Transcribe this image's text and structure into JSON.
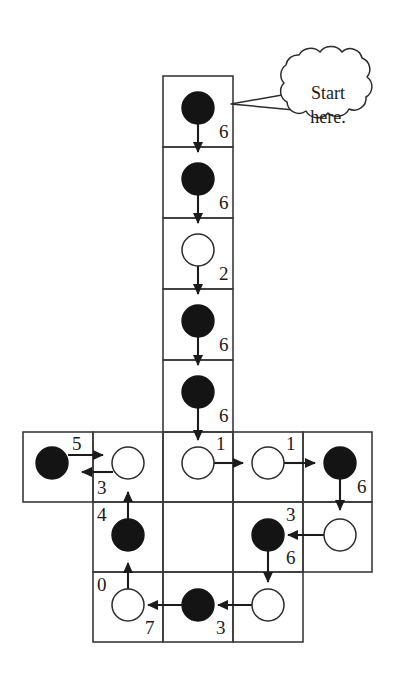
{
  "figure": {
    "callout": {
      "line1": "Start",
      "line2": "here.",
      "full_text": "Start here."
    },
    "colors": {
      "line": "#2b2b2b",
      "filled_token": "#141414",
      "empty_token": "#ffffff",
      "background": "#ffffff",
      "text": "#1a1a1a"
    },
    "grid": {
      "cell_size": 70,
      "columns_x": [
        23,
        93,
        163,
        233,
        303,
        372
      ],
      "rows_y": [
        76,
        147,
        218,
        289,
        360,
        432,
        502,
        572,
        642
      ]
    },
    "cells": [
      {
        "id": "c-r0",
        "col": 2,
        "row": 0,
        "x": 163,
        "y": 76,
        "token": "filled",
        "arrow": "down",
        "label": "6",
        "label_pos": "right-bottom"
      },
      {
        "id": "c-r1",
        "col": 2,
        "row": 1,
        "x": 163,
        "y": 147,
        "token": "filled",
        "arrow": "down",
        "label": "6",
        "label_pos": "right-bottom"
      },
      {
        "id": "c-r2",
        "col": 2,
        "row": 2,
        "x": 163,
        "y": 218,
        "token": "empty",
        "arrow": "down",
        "label": "2",
        "label_pos": "right-bottom"
      },
      {
        "id": "c-r3",
        "col": 2,
        "row": 3,
        "x": 163,
        "y": 289,
        "token": "filled",
        "arrow": "down",
        "label": "6",
        "label_pos": "right-bottom"
      },
      {
        "id": "c-r4",
        "col": 2,
        "row": 4,
        "x": 163,
        "y": 360,
        "token": "filled",
        "arrow": "down",
        "label": "6",
        "label_pos": "right-bottom"
      },
      {
        "id": "c-m0",
        "col": 0,
        "row": 5,
        "x": 23,
        "y": 432,
        "token": "filled",
        "arrow": "right",
        "label": "5",
        "label_pos": "above-right"
      },
      {
        "id": "c-m1",
        "col": 1,
        "row": 5,
        "x": 93,
        "y": 432,
        "token": "empty",
        "arrow": "left",
        "label": "3",
        "label_pos": "below-left"
      },
      {
        "id": "c-m2",
        "col": 2,
        "row": 5,
        "x": 163,
        "y": 432,
        "token": "empty",
        "arrow": "right",
        "label": "1",
        "label_pos": "above-right"
      },
      {
        "id": "c-m3",
        "col": 3,
        "row": 5,
        "x": 233,
        "y": 432,
        "token": "empty",
        "arrow": "right",
        "label": "1",
        "label_pos": "above-right"
      },
      {
        "id": "c-m4",
        "col": 4,
        "row": 5,
        "x": 303,
        "y": 432,
        "token": "filled",
        "arrow": "down",
        "label": "6",
        "label_pos": "right-bottom"
      },
      {
        "id": "c-l1",
        "col": 1,
        "row": 6,
        "x": 93,
        "y": 502,
        "token": "filled",
        "arrow": "up",
        "label": "4",
        "label_pos": "above-left"
      },
      {
        "id": "c-l3",
        "col": 3,
        "row": 6,
        "x": 233,
        "y": 502,
        "token": "filled",
        "arrow": "down",
        "label": "6",
        "label_pos": "right-bottom"
      },
      {
        "id": "c-l4",
        "col": 4,
        "row": 6,
        "x": 303,
        "y": 502,
        "token": "empty",
        "arrow": "left",
        "label": "3",
        "label_pos": "above-left"
      },
      {
        "id": "c-b1",
        "col": 1,
        "row": 7,
        "x": 93,
        "y": 572,
        "token": "empty",
        "arrow": "up",
        "label": "0",
        "label_pos": "above-left"
      },
      {
        "id": "c-b2",
        "col": 2,
        "row": 7,
        "x": 163,
        "y": 572,
        "token": "filled",
        "arrow": "left",
        "label": "7",
        "label_pos": "below-left"
      },
      {
        "id": "c-b3",
        "col": 3,
        "row": 7,
        "x": 233,
        "y": 572,
        "token": "empty",
        "arrow": "left",
        "label": "3",
        "label_pos": "below-left"
      }
    ],
    "labels": [
      {
        "id": "lab-1",
        "text": "6",
        "x": 219,
        "y": 122
      },
      {
        "id": "lab-2",
        "text": "6",
        "x": 219,
        "y": 193
      },
      {
        "id": "lab-3",
        "text": "2",
        "x": 219,
        "y": 264
      },
      {
        "id": "lab-4",
        "text": "6",
        "x": 219,
        "y": 335
      },
      {
        "id": "lab-5",
        "text": "6",
        "x": 219,
        "y": 406
      },
      {
        "id": "lab-6",
        "text": "5",
        "x": 72,
        "y": 434
      },
      {
        "id": "lab-7",
        "text": "3",
        "x": 97,
        "y": 478
      },
      {
        "id": "lab-8",
        "text": "1",
        "x": 216,
        "y": 434
      },
      {
        "id": "lab-9",
        "text": "1",
        "x": 286,
        "y": 434
      },
      {
        "id": "lab-10",
        "text": "6",
        "x": 357,
        "y": 477
      },
      {
        "id": "lab-11",
        "text": "4",
        "x": 97,
        "y": 505
      },
      {
        "id": "lab-12",
        "text": "3",
        "x": 286,
        "y": 505
      },
      {
        "id": "lab-13",
        "text": "6",
        "x": 286,
        "y": 548
      },
      {
        "id": "lab-14",
        "text": "0",
        "x": 97,
        "y": 575
      },
      {
        "id": "lab-15",
        "text": "7",
        "x": 145,
        "y": 618
      },
      {
        "id": "lab-16",
        "text": "3",
        "x": 216,
        "y": 618
      }
    ],
    "tokens": [
      {
        "id": "tok-1",
        "cx": 198,
        "cy": 108,
        "r": 16,
        "state": "filled"
      },
      {
        "id": "tok-2",
        "cx": 198,
        "cy": 179,
        "r": 16,
        "state": "filled"
      },
      {
        "id": "tok-3",
        "cx": 198,
        "cy": 250,
        "r": 16,
        "state": "empty"
      },
      {
        "id": "tok-4",
        "cx": 198,
        "cy": 321,
        "r": 16,
        "state": "filled"
      },
      {
        "id": "tok-5",
        "cx": 198,
        "cy": 392,
        "r": 16,
        "state": "filled"
      },
      {
        "id": "tok-6",
        "cx": 52,
        "cy": 463,
        "r": 16,
        "state": "filled"
      },
      {
        "id": "tok-7",
        "cx": 128,
        "cy": 463,
        "r": 16,
        "state": "empty"
      },
      {
        "id": "tok-8",
        "cx": 198,
        "cy": 463,
        "r": 16,
        "state": "empty"
      },
      {
        "id": "tok-9",
        "cx": 268,
        "cy": 463,
        "r": 16,
        "state": "empty"
      },
      {
        "id": "tok-10",
        "cx": 340,
        "cy": 463,
        "r": 16,
        "state": "filled"
      },
      {
        "id": "tok-11",
        "cx": 128,
        "cy": 535,
        "r": 16,
        "state": "filled"
      },
      {
        "id": "tok-12",
        "cx": 268,
        "cy": 535,
        "r": 16,
        "state": "filled"
      },
      {
        "id": "tok-13",
        "cx": 340,
        "cy": 535,
        "r": 16,
        "state": "empty"
      },
      {
        "id": "tok-14",
        "cx": 128,
        "cy": 605,
        "r": 16,
        "state": "empty"
      },
      {
        "id": "tok-15",
        "cx": 198,
        "cy": 605,
        "r": 16,
        "state": "filled"
      },
      {
        "id": "tok-16",
        "cx": 268,
        "cy": 605,
        "r": 16,
        "state": "empty"
      }
    ]
  }
}
